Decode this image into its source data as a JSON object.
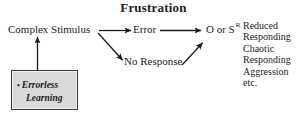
{
  "diagram": {
    "title": "Frustration",
    "nodes": {
      "complex_stimulus": "Complex Stimulus",
      "error": "Error",
      "no_response": "No Response",
      "outcome_symbol": "O or S",
      "outcome_superscript": "R"
    },
    "errorless_box": {
      "bullet": "•",
      "line1": "Errorless",
      "line2": "Learning",
      "fill_color": "#d9d9d9",
      "border_color": "#3a3a3a"
    },
    "outcomes": [
      "Reduced",
      "Responding",
      "Chaotic",
      "Responding",
      "Aggression",
      "etc."
    ],
    "arrow_color": "#1a1a1a"
  }
}
